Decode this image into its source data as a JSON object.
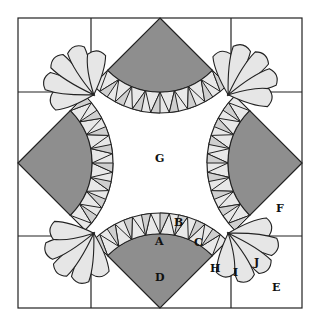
{
  "diagram": {
    "type": "quilt-block-pattern",
    "colors": {
      "background": "#ffffff",
      "outline": "#222222",
      "dark_fill": "#8e8e8e",
      "mid_fill": "#cfcfcf",
      "light_fill": "#e8e8e8",
      "petal_fill": "#e6e6e6"
    },
    "labels": {
      "A": "A",
      "B": "B",
      "C": "C",
      "D": "D",
      "E": "E",
      "F": "F",
      "G": "G",
      "H": "H",
      "I": "I",
      "J": "J"
    }
  }
}
